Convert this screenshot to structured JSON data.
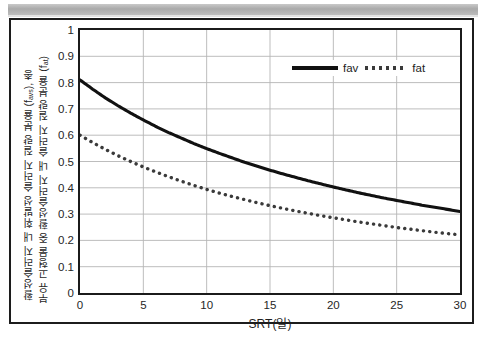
{
  "chart_data": {
    "type": "line",
    "title": "",
    "xlabel": "SRT(일)",
    "ylabel_outer": "활성슬러지 내 휘발성 슬러지 질량 분율 (f",
    "ylabel_outer_sub": "avs",
    "ylabel_outer_tail": "), 총",
    "ylabel_inner": "부유 고형물 중 활성슬러지 내 슬러지 질량 분율 (f",
    "ylabel_inner_sub": "at",
    "ylabel_inner_tail": ")",
    "xlim": [
      0,
      30
    ],
    "ylim": [
      0,
      1
    ],
    "grid": true,
    "legend_position": "top-right",
    "xticks": [
      "0",
      "5",
      "10",
      "15",
      "20",
      "25",
      "30"
    ],
    "yticks": [
      "0",
      "0.1",
      "0.2",
      "0.3",
      "0.4",
      "0.5",
      "0.6",
      "0.7",
      "0.8",
      "0.9",
      "1"
    ],
    "series": [
      {
        "name": "fav",
        "style": "solid",
        "color": "#111111",
        "x": [
          0,
          1,
          2,
          3,
          4,
          5,
          6,
          7,
          8,
          9,
          10,
          11,
          12,
          13,
          14,
          15,
          16,
          17,
          18,
          19,
          20,
          21,
          22,
          23,
          24,
          25,
          26,
          27,
          28,
          29,
          30
        ],
        "values": [
          0.81,
          0.775,
          0.742,
          0.712,
          0.684,
          0.658,
          0.633,
          0.61,
          0.589,
          0.568,
          0.549,
          0.531,
          0.514,
          0.497,
          0.482,
          0.467,
          0.453,
          0.44,
          0.427,
          0.415,
          0.403,
          0.392,
          0.381,
          0.371,
          0.361,
          0.352,
          0.343,
          0.334,
          0.326,
          0.318,
          0.31
        ]
      },
      {
        "name": "fat",
        "style": "dotted",
        "color": "#3a3a3a",
        "x": [
          0,
          1,
          2,
          3,
          4,
          5,
          6,
          7,
          8,
          9,
          10,
          11,
          12,
          13,
          14,
          15,
          16,
          17,
          18,
          19,
          20,
          21,
          22,
          23,
          24,
          25,
          26,
          27,
          28,
          29,
          30
        ],
        "values": [
          0.6,
          0.572,
          0.546,
          0.522,
          0.5,
          0.479,
          0.46,
          0.442,
          0.425,
          0.409,
          0.394,
          0.38,
          0.367,
          0.355,
          0.343,
          0.332,
          0.322,
          0.312,
          0.303,
          0.294,
          0.286,
          0.278,
          0.27,
          0.263,
          0.256,
          0.249,
          0.243,
          0.237,
          0.231,
          0.226,
          0.221
        ]
      }
    ]
  },
  "legend": {
    "fav_label": "fav",
    "fat_label": "fat"
  }
}
